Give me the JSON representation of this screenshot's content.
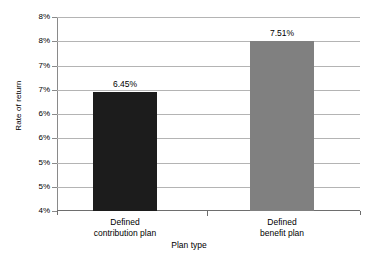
{
  "chart_data": {
    "type": "bar",
    "title": "",
    "xlabel": "Plan type",
    "ylabel": "Rate of return",
    "categories": [
      "Defined contribution plan",
      "Defined benefit plan"
    ],
    "values": [
      6.45,
      7.51
    ],
    "value_labels": [
      "6.45%",
      "7.51%"
    ],
    "series": [
      {
        "name": "Rate of return",
        "values": [
          6.45,
          7.51
        ]
      }
    ],
    "ylim": [
      4,
      8
    ],
    "ytick_values": [
      4,
      4.5,
      5,
      5.5,
      6,
      6.5,
      7,
      7.5,
      8
    ],
    "ytick_labels": [
      "4%",
      "5%",
      "5%",
      "6%",
      "6%",
      "7%",
      "7%",
      "8%",
      "8%"
    ],
    "grid": true,
    "legend": "none",
    "bar_colors": [
      "#1c1c1c",
      "#808080"
    ],
    "gridline_color": "#b4b4b4",
    "axis_color": "#6e6e6e",
    "background": "#ffffff"
  },
  "category_lines": [
    [
      "Defined",
      "contribution plan"
    ],
    [
      "Defined",
      "benefit plan"
    ]
  ]
}
